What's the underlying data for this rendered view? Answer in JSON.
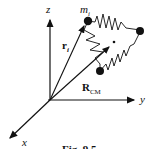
{
  "axes": {
    "z_label": "z",
    "y_label": "y",
    "x_label": "x"
  },
  "labels": {
    "mass": "m",
    "mass_sub": "i",
    "position_vector": "r",
    "position_sub": "i",
    "cm_vector": "R",
    "cm_sub": "CM"
  },
  "caption": "Fig. 9.5",
  "colors": {
    "ink": "#111111",
    "background": "#ffffff"
  }
}
